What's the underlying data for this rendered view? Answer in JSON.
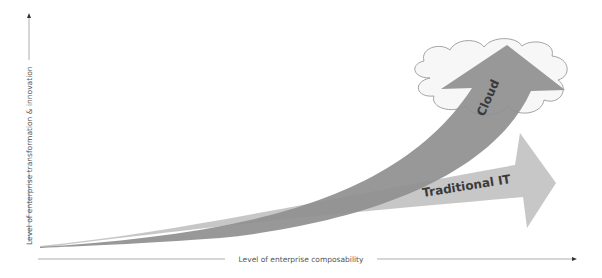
{
  "diagram": {
    "type": "conceptual-growth-comparison",
    "x_axis": {
      "label": "Level of enterprise composability"
    },
    "y_axis": {
      "label": "Level of enterprise transformation & innovation"
    },
    "arrows": [
      {
        "label": "Cloud",
        "color": "#8f8f8f",
        "trend": "steep exponential"
      },
      {
        "label": "Traditional IT",
        "color": "#c4c4c4",
        "trend": "gradual"
      }
    ],
    "cloud_shape": {
      "fill": "#f7f7f7",
      "stroke": "#9a9a9a"
    }
  }
}
